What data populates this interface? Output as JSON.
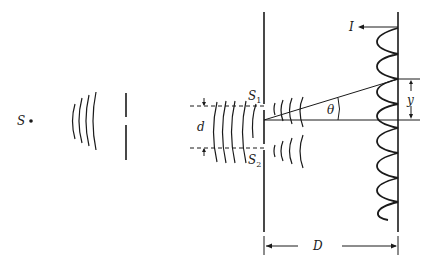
{
  "diagram": {
    "labels": {
      "source": "S",
      "slit1": "S",
      "slit1_sub": "1",
      "slit2": "S",
      "slit2_sub": "2",
      "separation": "d",
      "angle": "θ",
      "intensity": "I",
      "fringe_offset": "y",
      "distance": "D"
    },
    "colors": {
      "ink": "#1a1a1a",
      "background": "#ffffff"
    }
  }
}
